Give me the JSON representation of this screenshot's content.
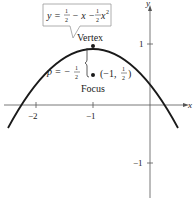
{
  "figure": {
    "equation": {
      "lhs": "y =",
      "frac1_num": "1",
      "frac1_den": "2",
      "mid": "− x −",
      "frac2_num": "1",
      "frac2_den": "2",
      "tail": "x",
      "exp": "2"
    },
    "vertex_label": "Vertex",
    "focus_label": "Focus",
    "p_label": "p = −",
    "p_num": "1",
    "p_den": "2",
    "focus_coord_prefix": "(−1,",
    "focus_coord_num": "1",
    "focus_coord_den": "2",
    "focus_coord_suffix": ")",
    "x_axis_label": "x",
    "y_axis_label": "y",
    "x_ticks": [
      "−2",
      "−1"
    ],
    "y_ticks": [
      "1",
      "−1"
    ],
    "colors": {
      "curve": "#1a1a1a",
      "axis": "#444444",
      "box": "#888888"
    }
  }
}
